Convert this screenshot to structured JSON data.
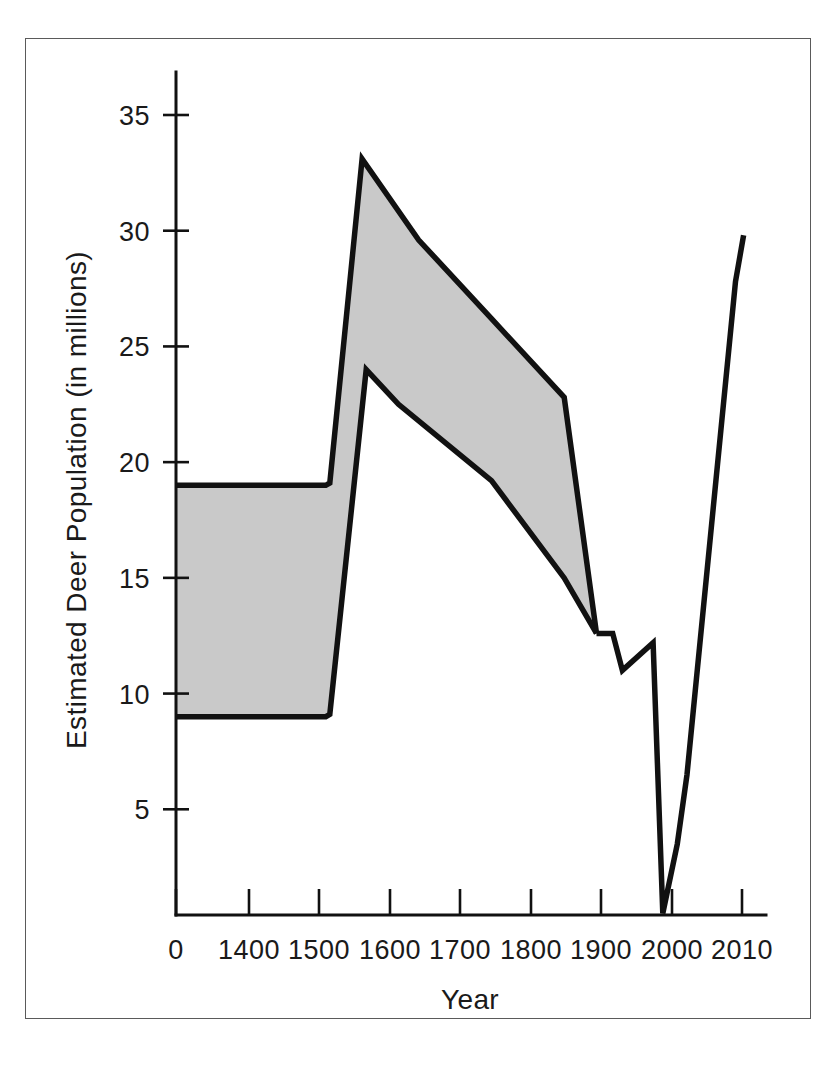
{
  "chart_data": {
    "type": "area",
    "title": "",
    "xlabel": "Year",
    "ylabel": "Estimated Deer Population (in millions)",
    "xlim": [
      0,
      2015
    ],
    "ylim": [
      0,
      37
    ],
    "grid": false,
    "legend": "none",
    "xtick_labels": [
      "0",
      "1400",
      "1500",
      "1600",
      "1700",
      "1800",
      "1900",
      "2000",
      "2010"
    ],
    "xtick_values": [
      0,
      1400,
      1500,
      1600,
      1700,
      1800,
      1900,
      2000,
      2010
    ],
    "ytick_labels": [
      "5",
      "10",
      "15",
      "20",
      "25",
      "30",
      "35"
    ],
    "ytick_values": [
      5,
      10,
      15,
      20,
      25,
      30,
      35
    ],
    "band": {
      "name": "Estimated range of deer population",
      "fill_color": "#c9c9c9",
      "line_color": "#111111",
      "upper": {
        "name": "High estimate",
        "x": [
          0,
          1495,
          1500,
          1540,
          1610,
          1700,
          1790,
          1830
        ],
        "y": [
          19.0,
          19.0,
          19.1,
          33.1,
          29.6,
          26.2,
          22.8,
          12.6
        ]
      },
      "lower": {
        "name": "Low estimate",
        "x": [
          0,
          1495,
          1500,
          1545,
          1585,
          1700,
          1790,
          1830
        ],
        "y": [
          9.0,
          9.0,
          9.1,
          24.0,
          22.5,
          19.2,
          15.0,
          12.6
        ]
      }
    },
    "single_line": {
      "name": "Deer population (single estimate)",
      "x": [
        1830,
        1850,
        1862,
        1900,
        1912,
        1930,
        1942,
        2002,
        2012
      ],
      "y": [
        12.6,
        12.6,
        11.0,
        12.2,
        0.5,
        3.5,
        6.5,
        27.8,
        29.8
      ]
    },
    "notes": {
      "minimum_value": 0.5,
      "minimum_year": 1912,
      "peak_high_estimate": 33.1,
      "peak_high_year": 1540,
      "final_value": 29.8,
      "final_year": 2012
    },
    "colors": {
      "line": "#111111",
      "band_fill": "#c9c9c9",
      "text": "#1a1a1a",
      "frame_border": "#5a5a5a",
      "background": "#ffffff"
    }
  }
}
